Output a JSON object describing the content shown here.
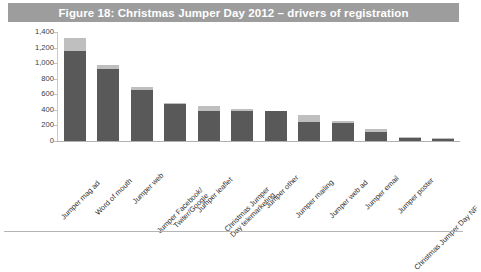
{
  "figure": {
    "title": "Figure 18: Christmas Jumper Day 2012 – drivers of registration",
    "title_bar_color": "#9d9d9d",
    "title_text_color": "#ffffff"
  },
  "colors": {
    "series_primary": "#595959",
    "series_secondary": "#bfbfbf",
    "axis": "#b0b0b0",
    "text": "#2e2e2e",
    "background": "#ffffff"
  },
  "chart_data": {
    "type": "bar",
    "title": "Figure 18: Christmas Jumper Day 2012 – drivers of registration",
    "xlabel": "",
    "ylabel": "",
    "ylim": [
      0,
      1400
    ],
    "yticks": [
      0,
      200,
      400,
      600,
      800,
      1000,
      1200,
      1400
    ],
    "ytick_labels": [
      "0",
      "200",
      "400",
      "600",
      "800",
      "1,000",
      "1,200",
      "1,400"
    ],
    "grid": false,
    "legend": "none",
    "stacked": true,
    "categories": [
      "Jumper mag ad",
      "Word of mouth",
      "Jumper web",
      "Jumper Facebook/ Twiter/Google",
      "Jumper leaflet",
      "Christmas Jumper Day telemarketing",
      "Jumper other",
      "Jumper mailing",
      "Jumper web ad",
      "Jumper email",
      "Jumper poster",
      "Christmas Jumper Day NF"
    ],
    "category_lines": [
      [
        "Jumper mag ad"
      ],
      [
        "Word of mouth"
      ],
      [
        "Jumper web"
      ],
      [
        "Jumper Facebook/",
        "Twiter/Google"
      ],
      [
        "Jumper leaflet"
      ],
      [
        "Christmas Jumper",
        "Day telemarketing"
      ],
      [
        "Jumper other"
      ],
      [
        "Jumper mailing"
      ],
      [
        "Jumper web ad"
      ],
      [
        "Jumper email"
      ],
      [
        "Jumper poster"
      ],
      [
        "Christmas Jumper Day NF"
      ]
    ],
    "series": [
      {
        "name": "primary",
        "color": "#595959",
        "values": [
          1160,
          930,
          660,
          470,
          390,
          390,
          390,
          250,
          230,
          120,
          40,
          30
        ]
      },
      {
        "name": "secondary",
        "color": "#bfbfbf",
        "values": [
          160,
          50,
          30,
          20,
          60,
          20,
          0,
          90,
          30,
          30,
          10,
          10
        ]
      }
    ],
    "totals": [
      1320,
      980,
      690,
      490,
      450,
      410,
      390,
      340,
      260,
      150,
      50,
      40
    ]
  }
}
